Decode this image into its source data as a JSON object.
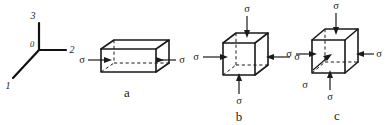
{
  "figure": {
    "background_color": "#ffffff",
    "ink_color": "#1a1a1a",
    "width": 385,
    "height": 125
  },
  "axes": {
    "name": "coordinate-triad",
    "origin_label": "0",
    "axis_1_label": "1",
    "axis_2_label": "2",
    "axis_3_label": "3"
  },
  "panels": {
    "a": {
      "caption": "a",
      "shape": "rectangular-prism",
      "stress_left": "σ",
      "stress_right": "σ"
    },
    "b": {
      "caption": "b",
      "shape": "cube",
      "stress_left": "σ",
      "stress_right": "σ",
      "stress_top": "σ",
      "stress_bottom": "σ"
    },
    "c": {
      "caption": "c",
      "shape": "cube",
      "stress_left": "σ",
      "stress_right": "σ",
      "stress_top": "σ",
      "stress_bottom": "σ",
      "stress_depth": "σ"
    }
  }
}
